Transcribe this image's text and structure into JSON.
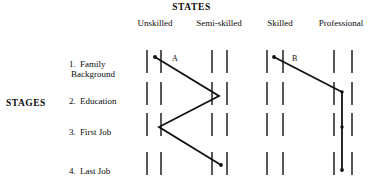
{
  "figure": {
    "states_title": "STATES",
    "stages_title": "STAGES",
    "states": [
      {
        "label": "Unskilled"
      },
      {
        "label": "Semi-skilled"
      },
      {
        "label": "Skilled"
      },
      {
        "label": "Professional"
      }
    ],
    "stages": [
      {
        "number": "1.",
        "line1": "Family",
        "line2": "Background"
      },
      {
        "number": "2.",
        "line1": "Education",
        "line2": ""
      },
      {
        "number": "3.",
        "line1": "First Job",
        "line2": ""
      },
      {
        "number": "4.",
        "line1": "Last Job",
        "line2": ""
      }
    ],
    "paths": [
      {
        "name": "A"
      },
      {
        "name": "B"
      }
    ],
    "ink_color": "#111111",
    "background_color": "#ffffff"
  },
  "chart_data": {
    "type": "line",
    "title": "STATES",
    "xlabel": "STATES",
    "ylabel": "STAGES",
    "grid": false,
    "legend": "none",
    "x_categories": [
      "Unskilled",
      "Semi-skilled",
      "Skilled",
      "Professional"
    ],
    "y_categories": [
      "1. Family Background",
      "2. Education",
      "3. First Job",
      "4. Last Job"
    ],
    "tick_columns_px": [
      147,
      161,
      212,
      227,
      267,
      283,
      334,
      352
    ],
    "row_bands_px": [
      [
        50,
        73
      ],
      [
        82,
        105
      ],
      [
        113,
        136
      ],
      [
        152,
        175
      ]
    ],
    "series": [
      {
        "name": "A",
        "label_position": {
          "x": 172,
          "y": 61
        },
        "start_marker": {
          "x": 155,
          "y": 57
        },
        "points": [
          {
            "stage": "1. Family Background",
            "state": "Unskilled",
            "x": 155,
            "y": 57
          },
          {
            "stage": "2. Education",
            "state": "Semi-skilled",
            "x": 219,
            "y": 96
          },
          {
            "stage": "3. First Job",
            "state": "Unskilled",
            "x": 159,
            "y": 127
          },
          {
            "stage": "4. Last Job",
            "state": "Semi-skilled",
            "x": 221,
            "y": 165
          }
        ]
      },
      {
        "name": "B",
        "label_position": {
          "x": 292,
          "y": 61
        },
        "start_marker": {
          "x": 274,
          "y": 57
        },
        "points": [
          {
            "stage": "1. Family Background",
            "state": "Skilled",
            "x": 274,
            "y": 57
          },
          {
            "stage": "2. Education",
            "state": "Professional",
            "x": 342,
            "y": 92
          },
          {
            "stage": "3. First Job",
            "state": "Professional",
            "x": 342,
            "y": 127
          },
          {
            "stage": "4. Last Job",
            "state": "Professional",
            "x": 342,
            "y": 170
          }
        ]
      }
    ]
  }
}
